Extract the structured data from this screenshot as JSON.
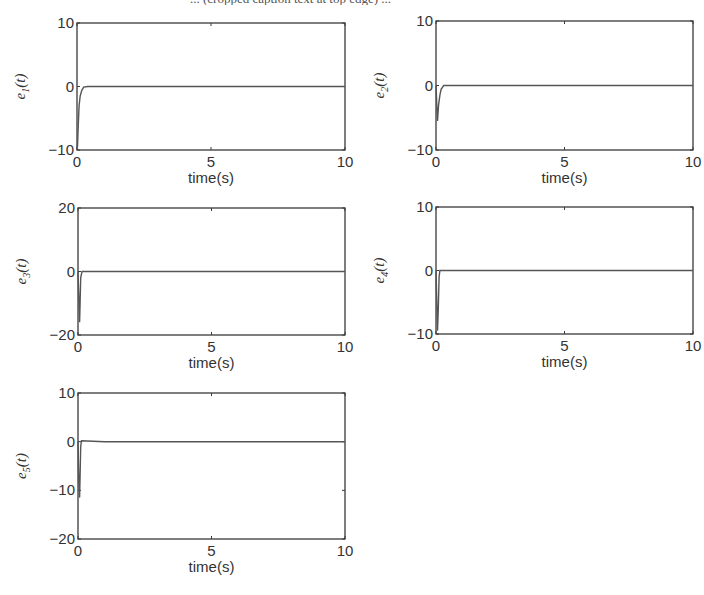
{
  "page": {
    "caption_fragment": "... (cropped caption text at top edge) ..."
  },
  "chart_data": [
    {
      "type": "line",
      "title": "",
      "xlabel": "time(s)",
      "ylabel": "e1(t)",
      "ylabel_base": "e",
      "ylabel_sub": "1",
      "ylabel_arg": "(t)",
      "xlim": [
        0,
        10
      ],
      "ylim": [
        -10,
        10
      ],
      "xticks": [
        0,
        5,
        10
      ],
      "yticks": [
        -10,
        0,
        10
      ],
      "grid": false,
      "box": {
        "x": 77,
        "y": 23,
        "w": 268,
        "h": 127
      },
      "x": [
        0,
        0.02,
        0.05,
        0.08,
        0.12,
        0.18,
        0.25,
        0.4,
        1,
        10
      ],
      "series": [
        {
          "name": "e1",
          "values": [
            -10,
            -9.5,
            -6,
            -3,
            -1.5,
            -0.6,
            -0.1,
            0,
            0,
            0
          ]
        }
      ]
    },
    {
      "type": "line",
      "title": "",
      "xlabel": "time(s)",
      "ylabel": "e2(t)",
      "ylabel_base": "e",
      "ylabel_sub": "2",
      "ylabel_arg": "(t)",
      "xlim": [
        0,
        10
      ],
      "ylim": [
        -10,
        10
      ],
      "xticks": [
        0,
        5,
        10
      ],
      "yticks": [
        -10,
        0,
        10
      ],
      "grid": false,
      "box": {
        "x": 436,
        "y": 21,
        "w": 257,
        "h": 129
      },
      "x": [
        0,
        0.03,
        0.06,
        0.1,
        0.15,
        0.2,
        0.3,
        1,
        10
      ],
      "series": [
        {
          "name": "e2",
          "values": [
            0,
            -3,
            -5.5,
            -3,
            -1.5,
            -0.6,
            0,
            0,
            0
          ]
        }
      ]
    },
    {
      "type": "line",
      "title": "",
      "xlabel": "time(s)",
      "ylabel": "e3(t)",
      "ylabel_base": "e",
      "ylabel_sub": "3",
      "ylabel_arg": "(t)",
      "xlim": [
        0,
        10
      ],
      "ylim": [
        -20,
        20
      ],
      "xticks": [
        0,
        5,
        10
      ],
      "yticks": [
        -20,
        0,
        20
      ],
      "grid": false,
      "box": {
        "x": 78,
        "y": 208,
        "w": 267,
        "h": 127
      },
      "x": [
        0,
        0.03,
        0.06,
        0.08,
        0.1,
        0.15,
        1,
        10
      ],
      "series": [
        {
          "name": "e3",
          "values": [
            0,
            -8,
            -16,
            -10,
            -2,
            0,
            0,
            0
          ]
        }
      ]
    },
    {
      "type": "line",
      "title": "",
      "xlabel": "time(s)",
      "ylabel": "e4(t)",
      "ylabel_base": "e",
      "ylabel_sub": "4",
      "ylabel_arg": "(t)",
      "xlim": [
        0,
        10
      ],
      "ylim": [
        -10,
        10
      ],
      "xticks": [
        0,
        5,
        10
      ],
      "yticks": [
        -10,
        0,
        10
      ],
      "grid": false,
      "box": {
        "x": 436,
        "y": 207,
        "w": 257,
        "h": 127
      },
      "x": [
        0,
        0.03,
        0.06,
        0.09,
        0.12,
        0.15,
        1,
        10
      ],
      "series": [
        {
          "name": "e4",
          "values": [
            0,
            -5,
            -9.5,
            -6,
            -1,
            0,
            0,
            0
          ]
        }
      ]
    },
    {
      "type": "line",
      "title": "",
      "xlabel": "time(s)",
      "ylabel": "e5(t)",
      "ylabel_base": "e",
      "ylabel_sub": "5",
      "ylabel_arg": "(t)",
      "xlim": [
        0,
        10
      ],
      "ylim": [
        -20,
        10
      ],
      "xticks": [
        0,
        5,
        10
      ],
      "yticks": [
        -20,
        -10,
        0,
        10
      ],
      "grid": false,
      "box": {
        "x": 78,
        "y": 393,
        "w": 267,
        "h": 146
      },
      "x": [
        0,
        0.03,
        0.06,
        0.08,
        0.1,
        0.13,
        1,
        10
      ],
      "series": [
        {
          "name": "e5",
          "values": [
            0,
            -8,
            -11.5,
            -7,
            -1,
            0.2,
            0,
            0
          ]
        }
      ]
    }
  ]
}
